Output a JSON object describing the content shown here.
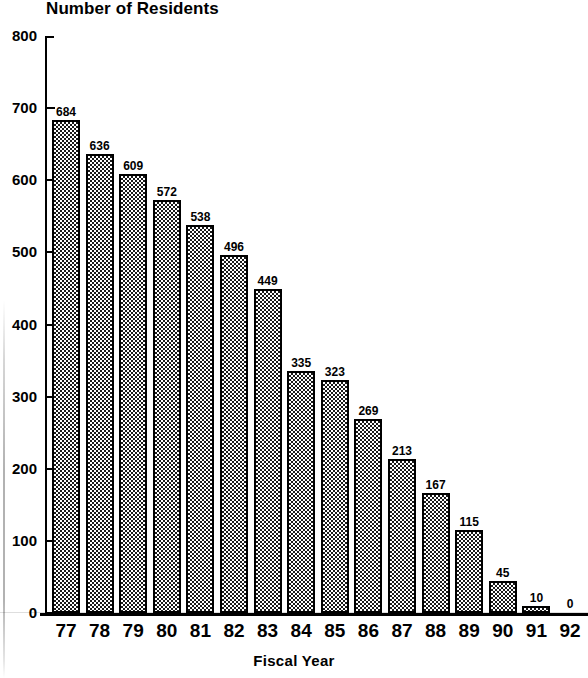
{
  "chart_data": {
    "type": "bar",
    "title": "Number of Residents",
    "xlabel": "Fiscal Year",
    "ylabel": "",
    "categories": [
      "77",
      "78",
      "79",
      "80",
      "81",
      "82",
      "83",
      "84",
      "85",
      "86",
      "87",
      "88",
      "89",
      "90",
      "91",
      "92"
    ],
    "values": [
      684,
      636,
      609,
      572,
      538,
      496,
      449,
      335,
      323,
      269,
      213,
      167,
      115,
      45,
      10,
      0
    ],
    "ylim": [
      0,
      800
    ],
    "ytick_labels": [
      "800",
      "700",
      "600",
      "500",
      "400",
      "300",
      "200",
      "100",
      "0"
    ],
    "ytick_values": [
      800,
      700,
      600,
      500,
      400,
      300,
      200,
      100,
      0
    ],
    "grid": false,
    "legend": false,
    "legend_position": "none",
    "bar_fill": "checkerboard-dither",
    "bar_outline_color": "#000000",
    "value_labels_shown": true
  },
  "colors": {
    "ink": "#000000",
    "paper": "#ffffff",
    "bar_pattern_dark": "#1a1a1a"
  }
}
